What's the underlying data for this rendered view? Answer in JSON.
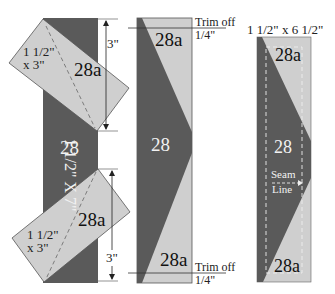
{
  "colors": {
    "dark": "#5a5a5a",
    "light": "#cfcfcf",
    "outline": "#444444",
    "background": "#ffffff"
  },
  "panel1": {
    "strip_label": "1 1/2\" X 7\"",
    "strip_piece": "28",
    "top_patch": {
      "piece": "28a",
      "size_line1": "1 1/2\"",
      "size_line2": "x 3\"",
      "dimension": "3\""
    },
    "bottom_patch": {
      "piece": "28a",
      "size_line1": "1 1/2\"",
      "size_line2": "x 3\"",
      "dimension": "3\""
    }
  },
  "panel2": {
    "top_piece": "28a",
    "center_piece": "28",
    "bottom_piece": "28a",
    "trim_top_line1": "Trim off",
    "trim_top_line2": "1/4\"",
    "trim_bottom_line1": "Trim off",
    "trim_bottom_line2": "1/4\""
  },
  "panel3": {
    "size_label": "1 1/2\" x 6 1/2\"",
    "top_piece": "28a",
    "center_piece": "28",
    "bottom_piece": "28a",
    "seam_line1": "Seam",
    "seam_line2": "Line"
  }
}
